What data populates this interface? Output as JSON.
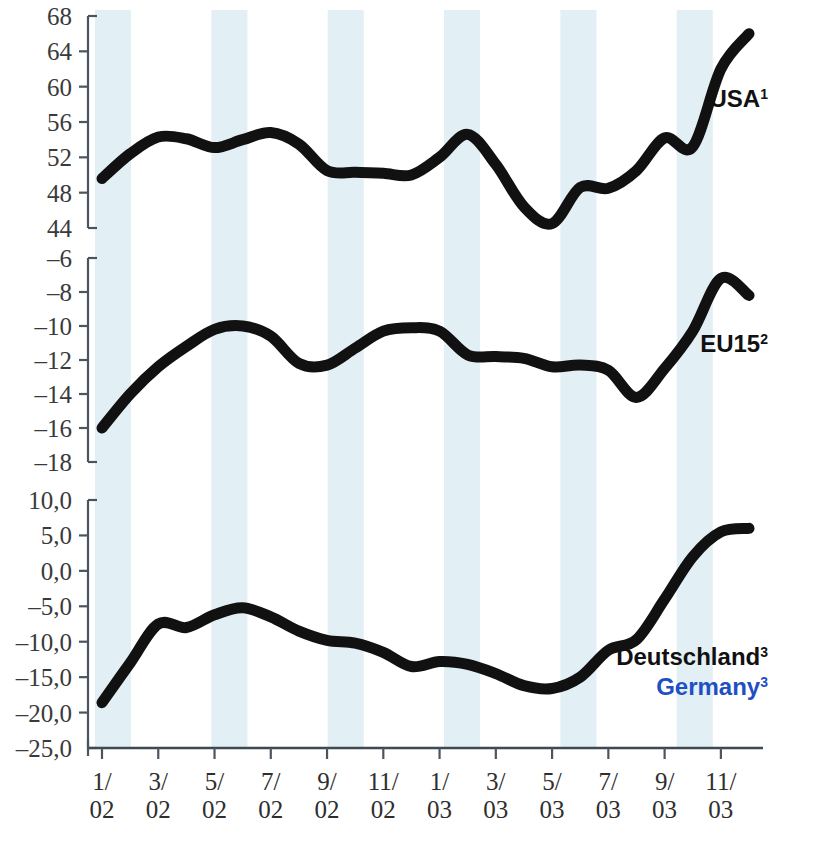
{
  "chart_data": {
    "type": "line",
    "title": "",
    "xlabel": "",
    "ylabel": "",
    "grid": false,
    "legend_position": "right-inline",
    "x": [
      "1/02",
      "2/02",
      "3/02",
      "4/02",
      "5/02",
      "6/02",
      "7/02",
      "8/02",
      "9/02",
      "10/02",
      "11/02",
      "12/02",
      "1/03",
      "2/03",
      "3/03",
      "4/03",
      "5/03",
      "6/03",
      "7/03",
      "8/03",
      "9/03",
      "10/03",
      "11/03"
    ],
    "xtick_labels": [
      "1/\n02",
      "3/\n02",
      "5/\n02",
      "7/\n02",
      "9/\n02",
      "11/\n02",
      "1/\n03",
      "3/\n03",
      "5/\n03",
      "7/\n03",
      "9/\n03",
      "11/\n03"
    ],
    "xtick_values": [
      "1/02",
      "3/02",
      "5/02",
      "7/02",
      "9/02",
      "11/02",
      "1/03",
      "3/03",
      "5/03",
      "7/03",
      "9/03",
      "11/03"
    ],
    "panels": [
      {
        "id": "usa",
        "label": "USA",
        "label_superscript": "1",
        "label_color": "#111111",
        "ylim": [
          44,
          68
        ],
        "ytick_labels": [
          "68",
          "64",
          "60",
          "56",
          "52",
          "48",
          "44"
        ],
        "ytick_values": [
          68,
          64,
          60,
          56,
          52,
          48,
          44
        ],
        "values": [
          49.6,
          52.4,
          54.3,
          54.1,
          53.1,
          54.0,
          54.8,
          53.5,
          50.5,
          50.3,
          50.2,
          50.0,
          52.0,
          54.6,
          51.2,
          46.4,
          44.5,
          48.6,
          48.5,
          50.5,
          54.2,
          53.2,
          62.0,
          66.0
        ],
        "series_name": "USA"
      },
      {
        "id": "eu15",
        "label": "EU15",
        "label_superscript": "2",
        "label_color": "#111111",
        "ylim": [
          -18,
          -6
        ],
        "ytick_labels": [
          "-6",
          "-8",
          "-10",
          "-12",
          "-14",
          "-16",
          "-18"
        ],
        "ytick_values": [
          -6,
          -8,
          -10,
          -12,
          -14,
          -16,
          -18
        ],
        "values": [
          -16.0,
          -14.0,
          -12.4,
          -11.2,
          -10.2,
          -10.0,
          -10.6,
          -12.2,
          -12.3,
          -11.3,
          -10.3,
          -10.1,
          -10.3,
          -11.7,
          -11.8,
          -11.9,
          -12.4,
          -12.3,
          -12.6,
          -14.2,
          -12.5,
          -10.3,
          -7.2,
          -8.2
        ],
        "series_name": "EU15"
      },
      {
        "id": "germany",
        "label": "Deutschland",
        "label_superscript": "3",
        "label_color": "#111111",
        "label_alt": "Germany",
        "label_alt_superscript": "3",
        "label_alt_color": "#1f4fc4",
        "ylim": [
          -25.0,
          10.0
        ],
        "ytick_labels": [
          "10,0",
          "5,0",
          "0,0",
          "-5,0",
          "-10,0",
          "-15,0",
          "-20,0",
          "-25,0"
        ],
        "ytick_values": [
          10.0,
          5.0,
          0.0,
          -5.0,
          -10.0,
          -15.0,
          -20.0,
          -25.0
        ],
        "values": [
          -18.6,
          -13.0,
          -7.5,
          -8.0,
          -6.2,
          -5.2,
          -6.5,
          -8.5,
          -9.8,
          -10.2,
          -11.5,
          -13.5,
          -12.8,
          -13.2,
          -14.5,
          -16.2,
          -16.6,
          -15.0,
          -11.2,
          -9.7,
          -4.0,
          2.0,
          5.5,
          6.0
        ],
        "series_name": "Deutschland / Germany"
      }
    ],
    "background_bands": {
      "color": "#e2f0f5",
      "note": "alternating two-month vertical bands"
    }
  },
  "footnote": {
    "left": "",
    "right": ""
  }
}
